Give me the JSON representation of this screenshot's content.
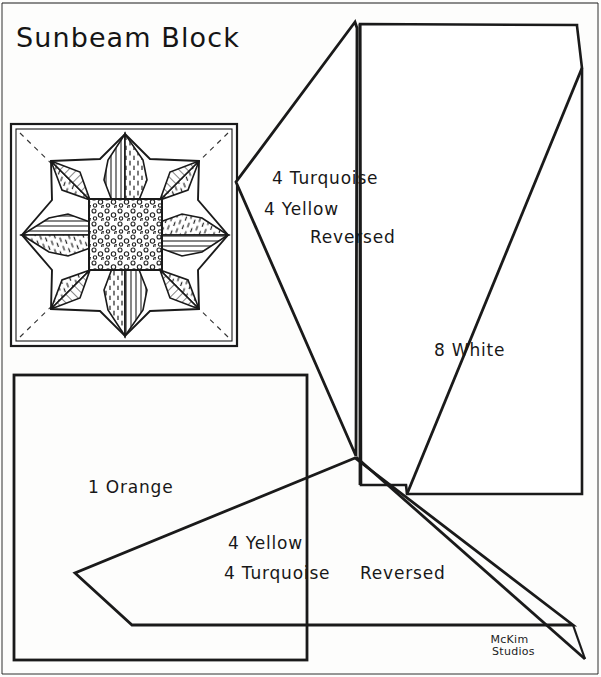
{
  "page": {
    "title": "Sunbeam Block",
    "kind": "quilt-block-pattern-sheet",
    "width": 601,
    "height": 677,
    "ink_color": "#1a1a1a",
    "paper_color": "#fdfdfc"
  },
  "block_diagram": {
    "name": "sunbeam-block-preview",
    "description": "Eight pointed star quilt block inside a square frame",
    "frame": {
      "x": 11,
      "y": 124,
      "width": 226,
      "height": 222
    },
    "star_points": 8,
    "center_square": {
      "x": 89,
      "y": 199,
      "width": 73,
      "height": 70,
      "fill_pattern": "dotted"
    },
    "petal_patterns": [
      "diagonal-hatch",
      "dash-speckle",
      "vertical-hatch",
      "horizontal-hatch"
    ],
    "corner_guides": "dashed-diagonal"
  },
  "pieces": [
    {
      "id": "piece-turquoise-yellow",
      "lines": [
        "4 Turquoise",
        "4 Yellow",
        "Reversed"
      ],
      "quantities": [
        4,
        4
      ],
      "fabrics": [
        "Turquoise",
        "Yellow"
      ],
      "reversed": true
    },
    {
      "id": "piece-white",
      "lines": [
        "8 White"
      ],
      "quantities": [
        8
      ],
      "fabrics": [
        "White"
      ],
      "reversed": false
    },
    {
      "id": "piece-orange",
      "lines": [
        "1 Orange"
      ],
      "quantities": [
        1
      ],
      "fabrics": [
        "Orange"
      ],
      "reversed": false
    },
    {
      "id": "piece-yellow-turquoise",
      "lines": [
        "4 Yellow",
        "4 Turquoise",
        "Reversed"
      ],
      "quantities": [
        4,
        4
      ],
      "fabrics": [
        "Yellow",
        "Turquoise"
      ],
      "reversed": true
    }
  ],
  "labels": {
    "turquoise_line1": "4 Turquoise",
    "turquoise_line2": "4 Yellow",
    "turquoise_line3": "Reversed",
    "white_line1": "8 White",
    "orange_line1": "1 Orange",
    "yellow_line1": "4 Yellow",
    "yellow_line2": "4 Turquoise",
    "yellow_line3": "Reversed"
  },
  "signature": {
    "line1": "McKim",
    "line2": "Studios"
  }
}
